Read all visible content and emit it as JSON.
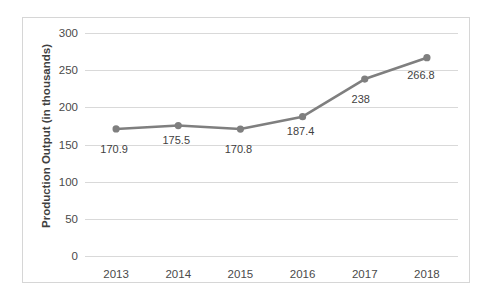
{
  "chart_data": {
    "type": "line",
    "title": "",
    "xlabel": "",
    "ylabel": "Production Output (in thousands)",
    "categories": [
      "2013",
      "2014",
      "2015",
      "2016",
      "2017",
      "2018"
    ],
    "values": [
      170.9,
      175.5,
      170.8,
      187.4,
      238,
      266.8
    ],
    "point_labels": [
      "170.9",
      "175.5",
      "170.8",
      "187.4",
      "238",
      "266.8"
    ],
    "ylim": [
      0,
      300
    ],
    "y_ticks": [
      0,
      50,
      100,
      150,
      200,
      250,
      300
    ],
    "y_tick_labels": [
      "0",
      "50",
      "100",
      "150",
      "200",
      "250",
      "300"
    ],
    "grid": true,
    "legend": false,
    "series_color": "#7f7f7f",
    "gridline_color": "#d9d9d9",
    "border_color": "#d6d6d6",
    "background_color": "#ffffff",
    "marker": "circle"
  }
}
